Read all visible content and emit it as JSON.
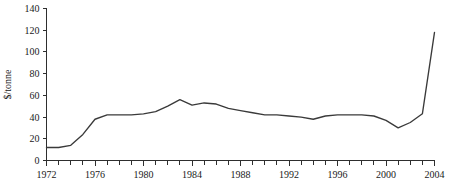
{
  "chart_data": {
    "type": "line",
    "title": "",
    "subtitle": "",
    "xlabel": "",
    "ylabel": "$/tonne",
    "xlim": [
      1972,
      2004
    ],
    "ylim": [
      0,
      140
    ],
    "grid": false,
    "legend": false,
    "legend_position": "none",
    "x_tick_labels": [
      "1972",
      "1976",
      "1980",
      "1984",
      "1988",
      "1992",
      "1996",
      "2000",
      "2004"
    ],
    "x_tick_values": [
      1972,
      1976,
      1980,
      1984,
      1988,
      1992,
      1996,
      2000,
      2004
    ],
    "x_minor_tick_step": 1,
    "y_tick_labels": [
      "0",
      "20",
      "40",
      "60",
      "80",
      "100",
      "120",
      "140"
    ],
    "y_tick_values": [
      0,
      20,
      40,
      60,
      80,
      100,
      120,
      140
    ],
    "series": [
      {
        "name": "price",
        "color": "#3a3a3a",
        "x": [
          1972,
          1973,
          1974,
          1975,
          1976,
          1977,
          1978,
          1979,
          1980,
          1981,
          1982,
          1983,
          1984,
          1985,
          1986,
          1987,
          1988,
          1989,
          1990,
          1991,
          1992,
          1993,
          1994,
          1995,
          1996,
          1997,
          1998,
          1999,
          2000,
          2001,
          2002,
          2003,
          2004
        ],
        "values": [
          12,
          12,
          14,
          24,
          38,
          42,
          42,
          42,
          43,
          45,
          50,
          56,
          51,
          53,
          52,
          48,
          46,
          44,
          42,
          42,
          41,
          40,
          38,
          41,
          42,
          42,
          42,
          41,
          37,
          30,
          35,
          43,
          118
        ]
      }
    ]
  }
}
